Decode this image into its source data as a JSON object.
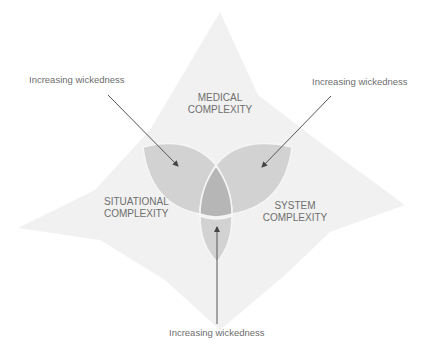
{
  "diagram": {
    "title": "",
    "regions": {
      "medical": {
        "line1": "MEDICAL",
        "line2": "COMPLEXITY"
      },
      "situational": {
        "line1": "SITUATIONAL",
        "line2": "COMPLEXITY"
      },
      "system": {
        "line1": "SYSTEM",
        "line2": "COMPLEXITY"
      }
    },
    "callouts": {
      "top_left": "Increasing wickedness",
      "top_right": "Increasing wickedness",
      "bottom": "Increasing wickedness"
    },
    "colors": {
      "background_shape": "#efefef",
      "petal": "#cfcfcf",
      "center": "#b4b4b4",
      "outline": "#f4f4f4",
      "arrow": "#555555",
      "text": "#6e6e6e"
    }
  }
}
